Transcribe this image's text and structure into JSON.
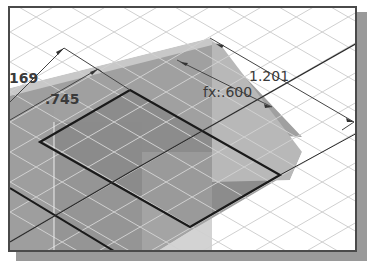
{
  "view": {
    "type": "isometric-sketch-view",
    "background_color": "#ffffff",
    "grid_color": "#d4d4d4",
    "slab_color": "#8f8f8f",
    "slab_light_color": "#bdbdbd",
    "sketch_line_color": "#1a1a1a",
    "frame_shadow_color": "#9a9a9a"
  },
  "dimensions": [
    {
      "id": "dim-169",
      "label": "169"
    },
    {
      "id": "dim-745",
      "label": ".745"
    },
    {
      "id": "dim-600",
      "label": "fx:.600"
    },
    {
      "id": "dim-1201",
      "label": "1.201"
    }
  ]
}
